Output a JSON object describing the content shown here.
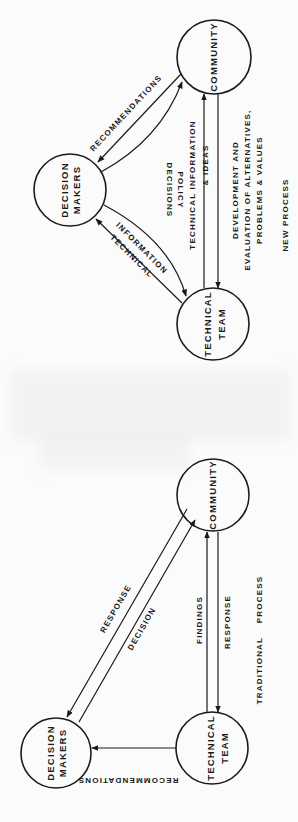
{
  "figure": {
    "orientation": "rotated 90 degrees clockwise",
    "colors": {
      "ink": "#1a1a1a",
      "paper": "#fbfbfb",
      "smudge": "#ececec"
    }
  },
  "new_process": {
    "title": "NEW PROCESS",
    "nodes": {
      "community": "COMMUNITY",
      "decision_makers": {
        "line1": "DECISION",
        "line2": "MAKERS"
      },
      "technical_team": {
        "line1": "TECHNICAL",
        "line2": "TEAM"
      }
    },
    "edges": {
      "recommendations": "RECOMMENDATIONS",
      "policy_decisions": {
        "line1": "POLICY",
        "line2": "DECISIONS"
      },
      "technical_information": {
        "line1": "TECHNICAL",
        "line2": "INFORMATION"
      },
      "tech_info_ideas": {
        "line1": "TECHNICAL    INFORMATION",
        "line2": "& IDEAS"
      },
      "development": {
        "line1": "DEVELOPMENT       AND",
        "line2": "EVALUATION  OF  ALTERNATIVES,",
        "line3": "PROBLEMS   &   VALUES"
      }
    }
  },
  "traditional_process": {
    "title": "TRADITIONAL    PROCESS",
    "nodes": {
      "community": "COMMUNITY",
      "decision_makers": {
        "line1": "DECISION",
        "line2": "MAKERS"
      },
      "technical_team": {
        "line1": "TECHNICAL",
        "line2": "TEAM"
      }
    },
    "edges": {
      "response_dm": "RESPONSE",
      "decision": "DECISION",
      "findings": "FINDINGS",
      "response_tt": "RESPONSE",
      "recommendations": "RECOMMENDATIONS"
    }
  }
}
